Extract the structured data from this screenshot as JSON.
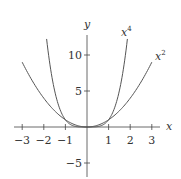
{
  "chart_data": {
    "type": "line",
    "title": "",
    "xlabel": "x",
    "ylabel": "y",
    "xlim": [
      -3.2,
      3.3
    ],
    "ylim": [
      -6.8,
      12.8
    ],
    "grid": false,
    "x_ticks": [
      -3,
      -2,
      -1,
      1,
      2,
      3
    ],
    "x_tick_labels": [
      "−3",
      "−2",
      "−1",
      "1",
      "2",
      "3"
    ],
    "y_ticks": [
      10,
      5,
      -5
    ],
    "y_tick_labels": [
      "10",
      "5",
      "−5"
    ],
    "series": [
      {
        "name": "x^2",
        "label": "x",
        "exponent": "2",
        "x": [
          -3,
          -2.5,
          -2,
          -1.5,
          -1,
          -0.5,
          0,
          0.5,
          1,
          1.5,
          2,
          2.5,
          3
        ],
        "values": [
          9,
          6.25,
          4,
          2.25,
          1,
          0.25,
          0,
          0.25,
          1,
          2.25,
          4,
          6.25,
          9
        ]
      },
      {
        "name": "x^4",
        "label": "x",
        "exponent": "4",
        "x": [
          -1.87,
          -1.5,
          -1,
          -0.5,
          0,
          0.5,
          1,
          1.5,
          1.87
        ],
        "values": [
          12.2,
          5.06,
          1,
          0.0625,
          0,
          0.0625,
          1,
          5.06,
          12.2
        ]
      }
    ],
    "legend": "inline labels near curve ends (top-right)"
  }
}
